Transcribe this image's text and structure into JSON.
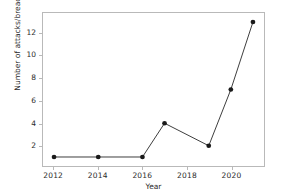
{
  "chart_data": {
    "type": "line",
    "title": "",
    "xlabel": "Year",
    "ylabel": "Number of attacks/breaches",
    "x": [
      2012,
      2014,
      2016,
      2017,
      2019,
      2020,
      2021
    ],
    "values": [
      1,
      1,
      1,
      4,
      2,
      7,
      13
    ],
    "series": [
      {
        "name": "Number of attacks/breaches",
        "x": [
          2012,
          2014,
          2016,
          2017,
          2019,
          2020,
          2021
        ],
        "values": [
          1,
          1,
          1,
          4,
          2,
          7,
          13
        ]
      }
    ],
    "xlim": [
      2011.5,
      2021.5
    ],
    "ylim": [
      0.2,
      13.8
    ],
    "xticks": [
      2012,
      2014,
      2016,
      2018,
      2020
    ],
    "xtick_labels": [
      "2012",
      "2014",
      "2016",
      "2018",
      "2020"
    ],
    "yticks": [
      2,
      4,
      6,
      8,
      10,
      12
    ],
    "ytick_labels": [
      "2",
      "4",
      "6",
      "8",
      "10",
      "12"
    ],
    "grid": false,
    "legend": false,
    "legend_position": "none",
    "marker": "circle",
    "line_color": "#3c3c3c",
    "marker_color": "#1a1a1a",
    "axes_color": "#b9b9b9",
    "background_color": "#ffffff"
  }
}
